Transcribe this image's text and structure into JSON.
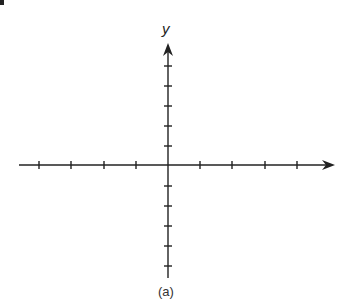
{
  "chart_data": {
    "type": "coordinate-plane",
    "title": "",
    "x_axis": {
      "label": "",
      "arrow": "right",
      "ticks_left_of_origin": 4,
      "ticks_right_of_origin": 4,
      "tick_labels": []
    },
    "y_axis": {
      "label": "y",
      "arrow": "up",
      "ticks_above_origin": 5,
      "ticks_below_origin": 5,
      "tick_labels": []
    },
    "grid": false,
    "data": []
  },
  "figure": {
    "y_axis_label": "y",
    "caption": "(a)",
    "stroke_color": "#222222",
    "background": "#ffffff"
  },
  "geometry": {
    "origin": [
      168,
      165
    ],
    "x_axis_start": 19,
    "x_axis_end": 335,
    "y_axis_top": 43,
    "y_axis_bottom": 278,
    "x_ticks": [
      39,
      71,
      104,
      136,
      200,
      232,
      265,
      297
    ],
    "y_ticks": [
      66,
      86,
      106,
      126,
      146,
      186,
      206,
      226,
      246,
      266
    ]
  }
}
